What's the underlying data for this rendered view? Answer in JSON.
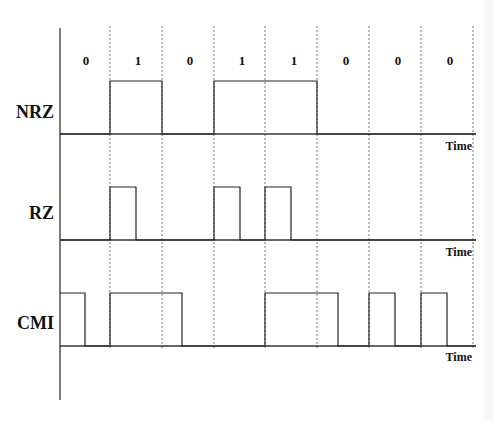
{
  "diagram": {
    "bits": [
      "0",
      "1",
      "0",
      "1",
      "1",
      "0",
      "0",
      "0"
    ],
    "signals": [
      {
        "name": "NRZ",
        "time_label": "Time"
      },
      {
        "name": "RZ",
        "time_label": "Time"
      },
      {
        "name": "CMI",
        "time_label": "Time"
      }
    ],
    "colors": {
      "line": "#222222",
      "grid": "#555555",
      "background": "#ffffff"
    }
  },
  "layout": {
    "axis_x": 60,
    "axis_top": 28,
    "axis_bottom": 400,
    "bit_start_x": 58,
    "bit_width": 52,
    "axis_end_x": 476,
    "grid_x": [
      110,
      162,
      214,
      265,
      317,
      369,
      421,
      473
    ],
    "grid_top": 26,
    "grid_bottom": 348,
    "bit_label_y": 65,
    "rows": [
      {
        "baseline": 134,
        "high": 81,
        "label_y": 118,
        "time_y": 150
      },
      {
        "baseline": 240,
        "high": 187,
        "label_y": 219,
        "time_y": 256
      },
      {
        "baseline": 346,
        "high": 293,
        "label_y": 329,
        "time_y": 361
      }
    ]
  },
  "waveforms": {
    "NRZ": [
      [
        60,
        0
      ],
      [
        110,
        0
      ],
      [
        110,
        1
      ],
      [
        162,
        1
      ],
      [
        162,
        0
      ],
      [
        214,
        0
      ],
      [
        214,
        1
      ],
      [
        317,
        1
      ],
      [
        317,
        0
      ],
      [
        476,
        0
      ]
    ],
    "RZ": [
      [
        60,
        0
      ],
      [
        110,
        0
      ],
      [
        110,
        1
      ],
      [
        136,
        1
      ],
      [
        136,
        0
      ],
      [
        214,
        0
      ],
      [
        214,
        1
      ],
      [
        240,
        1
      ],
      [
        240,
        0
      ],
      [
        265,
        0
      ],
      [
        265,
        1
      ],
      [
        291,
        1
      ],
      [
        291,
        0
      ],
      [
        476,
        0
      ]
    ],
    "CMI": [
      [
        60,
        1
      ],
      [
        85,
        1
      ],
      [
        85,
        0
      ],
      [
        110,
        0
      ],
      [
        110,
        1
      ],
      [
        182,
        1
      ],
      [
        182,
        0
      ],
      [
        265,
        0
      ],
      [
        265,
        1
      ],
      [
        338,
        1
      ],
      [
        338,
        0
      ],
      [
        369,
        0
      ],
      [
        369,
        1
      ],
      [
        395,
        1
      ],
      [
        395,
        0
      ],
      [
        421,
        0
      ],
      [
        421,
        1
      ],
      [
        447,
        1
      ],
      [
        447,
        0
      ],
      [
        476,
        0
      ]
    ]
  }
}
